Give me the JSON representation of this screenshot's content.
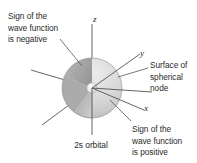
{
  "figure": {
    "caption": "2s orbital",
    "background_color": "#ffffff"
  },
  "annotations": {
    "sign_negative": "Sign of the\nwave function\nis negative",
    "spherical_node": "Surface of\nspherical\nnode",
    "sign_positive": "Sign of the\nwave function\nis positive"
  },
  "axes": {
    "z_label": "z",
    "y_label": "y",
    "x_label": "x"
  },
  "colors": {
    "outer_sphere_light": "#e2e2e2",
    "outer_sphere_mid": "#cfcfcf",
    "cutaway_dark": "#9d9d9d",
    "cutaway_mid": "#b4b4b4",
    "inner_node_highlight": "#f2f2f2",
    "axis_line": "#4a4a4a",
    "leader_line": "#555555",
    "text": "#2b2b2b"
  }
}
